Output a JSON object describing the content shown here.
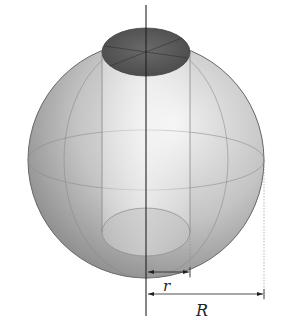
{
  "figure": {
    "labels": {
      "small_radius": "r",
      "large_radius": "R"
    },
    "colors": {
      "sphere_light": "#e6e6e6",
      "sphere_dark": "#8a8a8a",
      "hole_top": "#5a5a5a",
      "lines": "#333333"
    }
  }
}
